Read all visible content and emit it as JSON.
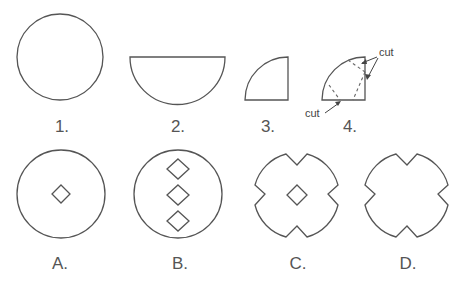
{
  "steps": [
    {
      "label": "1.",
      "shape": "full circle"
    },
    {
      "label": "2.",
      "shape": "folded in half (semicircle)"
    },
    {
      "label": "3.",
      "shape": "folded into quarter"
    },
    {
      "label": "4.",
      "shape": "quarter with cuts"
    }
  ],
  "annotations": {
    "cut_top": "cut",
    "cut_bottom": "cut"
  },
  "options": [
    {
      "label": "A.",
      "shape": "circle with one center diamond hole"
    },
    {
      "label": "B.",
      "shape": "circle with three vertical diamond holes"
    },
    {
      "label": "C.",
      "shape": "notched circle with center diamond hole"
    },
    {
      "label": "D.",
      "shape": "notched circle without hole"
    }
  ]
}
